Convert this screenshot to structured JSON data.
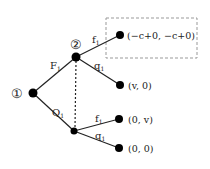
{
  "diagram": {
    "type": "game-tree",
    "nodes": {
      "root": {
        "label": "①"
      },
      "player2": {
        "label": "②"
      }
    },
    "edges": {
      "root_to_p2": {
        "label": "F",
        "sub": "1"
      },
      "root_to_lower": {
        "label": "Q",
        "sub": "1"
      },
      "p2_to_leaf1": {
        "label": "f",
        "sub": "1"
      },
      "p2_to_leaf2": {
        "label": "q",
        "sub": "1"
      },
      "lower_to_leaf3": {
        "label": "f",
        "sub": "1"
      },
      "lower_to_leaf4": {
        "label": "q",
        "sub": "1"
      }
    },
    "payoffs": [
      {
        "text": "(−c+0, −c+0)",
        "highlighted": true
      },
      {
        "text": "(v, 0)"
      },
      {
        "text": "(0, v)"
      },
      {
        "text": "(0, 0)"
      }
    ],
    "colors": {
      "line": "#222222",
      "node": "#000000",
      "box": "#999999"
    }
  }
}
